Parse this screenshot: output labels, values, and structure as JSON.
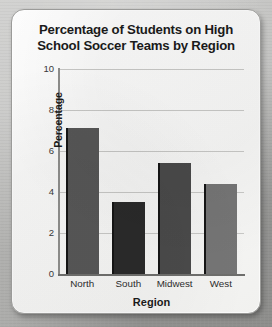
{
  "card": {
    "title_line1": "Percentage of Students on High",
    "title_line2": "School Soccer Teams by Region"
  },
  "chart_data": {
    "type": "bar",
    "title": "Percentage of Students on High School Soccer Teams by Region",
    "xlabel": "Region",
    "ylabel": "Percentage",
    "categories": [
      "North",
      "South",
      "Midwest",
      "West"
    ],
    "values": [
      7.1,
      3.5,
      5.4,
      4.4
    ],
    "bar_colors": [
      "#575757",
      "#2a2a2a",
      "#4a4a4a",
      "#757575"
    ],
    "ylim": [
      0,
      10
    ],
    "yticks": [
      0,
      2,
      4,
      6,
      8,
      10
    ],
    "ytick_labels": [
      "0",
      "2",
      "4",
      "6",
      "8",
      "10"
    ],
    "grid": "horizontal",
    "legend": "none"
  }
}
